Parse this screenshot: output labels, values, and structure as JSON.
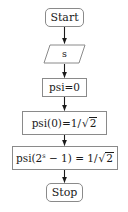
{
  "diagram": {
    "background_color": "#ffffff",
    "border_color": "#8a8a8a",
    "text_color": "#1a1a1a",
    "arrow_color": "#1a1a1a"
  },
  "nodes": [
    {
      "id": "start",
      "shape": "rounded-rectangle",
      "label": "Start"
    },
    {
      "id": "input-s",
      "shape": "parallelogram",
      "label": "s"
    },
    {
      "id": "psi-init",
      "shape": "rectangle",
      "label": "psi=0"
    },
    {
      "id": "psi-zero",
      "shape": "rectangle",
      "label_prefix": "psi(0)=1/",
      "sqrt_radicand": "2",
      "label_full": "psi(0)=1/√2"
    },
    {
      "id": "psi-final",
      "shape": "rectangle",
      "label_prefix": "psi(2",
      "label_exponent": "s",
      "label_middle": " − 1) = 1/",
      "sqrt_radicand": "2",
      "label_full": "psi(2^s − 1) = 1/√2"
    },
    {
      "id": "stop",
      "shape": "rounded-rectangle",
      "label": "Stop"
    }
  ],
  "edges": [
    {
      "from": "start",
      "to": "input-s",
      "arrowhead": "filled-triangle"
    },
    {
      "from": "input-s",
      "to": "psi-init",
      "arrowhead": "filled-triangle"
    },
    {
      "from": "psi-init",
      "to": "psi-zero",
      "arrowhead": "filled-triangle"
    },
    {
      "from": "psi-zero",
      "to": "psi-final",
      "arrowhead": "filled-triangle"
    },
    {
      "from": "psi-final",
      "to": "stop",
      "arrowhead": "filled-triangle"
    }
  ]
}
